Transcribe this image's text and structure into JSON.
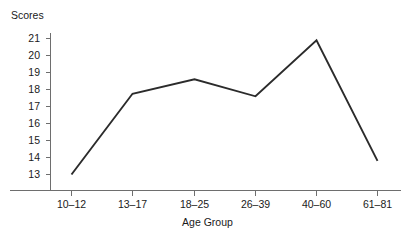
{
  "chart_data": {
    "type": "line",
    "title": "",
    "xlabel": "Age Group",
    "ylabel": "Scores",
    "categories": [
      "10–12",
      "13–17",
      "18–25",
      "26–39",
      "40–60",
      "61–81"
    ],
    "values": [
      13.0,
      17.75,
      18.6,
      17.6,
      20.9,
      13.8
    ],
    "series": [
      {
        "name": "Scores",
        "values": [
          13.0,
          17.75,
          18.6,
          17.6,
          20.9,
          13.8
        ]
      }
    ],
    "ylim": [
      12.6,
      21.4
    ],
    "yticks": [
      13,
      14,
      15,
      16,
      17,
      18,
      19,
      20,
      21
    ],
    "ytick_labels": [
      "13",
      "14",
      "15",
      "16",
      "17",
      "18",
      "19",
      "20",
      "21"
    ],
    "xtick_labels": [
      "10–12",
      "13–17",
      "18–25",
      "26–39",
      "40–60",
      "61–81"
    ],
    "grid": false,
    "legend": false,
    "legend_position": "none",
    "line_color": "#2b2b2b",
    "axis_color": "#6e6e6e",
    "background_color": "#ffffff",
    "markers": false
  },
  "labels": {
    "y_axis_title": "Scores",
    "x_axis_title": "Age Group"
  }
}
